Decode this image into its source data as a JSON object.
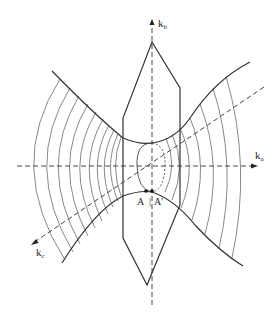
{
  "figure": {
    "axes": [
      {
        "id": "kb",
        "label": "k",
        "subscript": "b",
        "direction": "vertical-up"
      },
      {
        "id": "ka",
        "label": "k",
        "subscript": "a",
        "direction": "horizontal-right"
      },
      {
        "id": "kc",
        "label": "k",
        "subscript": "c",
        "direction": "diagonal-lower-left"
      }
    ],
    "points": [
      {
        "id": "A",
        "label": "A"
      },
      {
        "id": "A_prime",
        "label": "A'"
      }
    ],
    "separator": "|",
    "colors": {
      "line": "#333333",
      "background": "#ffffff"
    }
  }
}
